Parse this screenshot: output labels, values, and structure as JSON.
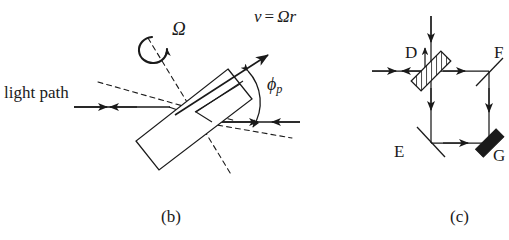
{
  "figure": {
    "type": "scientific-diagram",
    "background_color": "#ffffff",
    "ink_color": "#1a1a1a"
  },
  "panel_b": {
    "caption": "(b)",
    "labels": {
      "light_path": "light path",
      "omega": "Ω",
      "velocity_v": "v",
      "velocity_eq": "=",
      "velocity_expr": "Ωr",
      "phi": "ϕ",
      "phi_subscript": "p"
    },
    "elements": {
      "plate": "tilted-rectangular-plate",
      "rotation_arrow": "curved-rotation-arrow",
      "velocity_arrow": "straight-arrow-up-right",
      "angle_arc": "double-headed-curved-arc",
      "beam_left": "counter-propagating-horizontal-beam",
      "beam_right": "counter-propagating-horizontal-beam",
      "construction_lines": "dashed"
    }
  },
  "panel_c": {
    "caption": "(c)",
    "labels": {
      "beamsplitter": "D",
      "mirror_top_right": "F",
      "mirror_bottom_left": "E",
      "element_bottom_right": "G"
    },
    "elements": {
      "D": "hatched-beam-splitter",
      "E": "thin-line-mirror",
      "F": "thin-line-mirror",
      "G": "solid-black-mirror",
      "input_beam_top": "vertical-arrow-down",
      "output_beam_up": "vertical-arrow-up",
      "input_beam_left": "counter-propagating-horizontal-beam",
      "loop": "square-ring-path"
    }
  }
}
